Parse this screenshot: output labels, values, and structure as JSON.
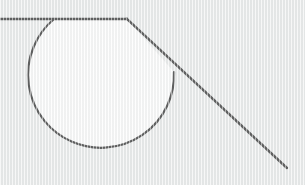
{
  "figure": {
    "width": 305,
    "height": 185,
    "background_color": "#e9ebeb",
    "stroke_color": "#2a2a2a",
    "stroke_width": 2.2,
    "sector_fill_color": "#fcfcfc",
    "texture": "vertical-ribbed-scanlines"
  },
  "geometry": {
    "vertex": {
      "label": "angle-vertex",
      "x": 127,
      "y": 19
    },
    "rays": [
      {
        "name": "horizontal-ray",
        "from": {
          "x": 0,
          "y": 19
        },
        "to": {
          "x": 127,
          "y": 19
        },
        "direction_degrees": 180,
        "description": "horizontal ray extending left from the vertex to the image edge"
      },
      {
        "name": "descending-ray",
        "from": {
          "x": 127,
          "y": 19
        },
        "to": {
          "x": 287,
          "y": 168
        },
        "direction_degrees": 43,
        "description": "ray descending to the lower right from the vertex"
      }
    ],
    "arc": {
      "name": "angle-arc",
      "center": {
        "x": 127,
        "y": 19
      },
      "radius": 73,
      "start_point": {
        "x": 54,
        "y": 19
      },
      "end_point": {
        "x": 174,
        "y": 72
      },
      "bottom_point": {
        "x": 118,
        "y": 93
      },
      "start_angle_degrees": 180,
      "end_angle_degrees": 43,
      "sweep_degrees": 223,
      "sweep_direction": "clockwise",
      "path_d": "M 127 19 L 54 19 A 73 73 0 1 0 174.40 72.36 Z"
    }
  },
  "annotations": {
    "has_labels": false,
    "has_text": false,
    "has_axis": false,
    "has_legend": false
  }
}
